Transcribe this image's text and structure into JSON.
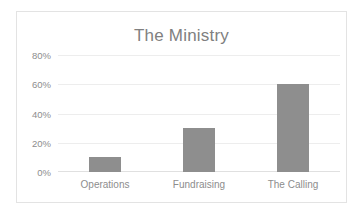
{
  "chart_data": {
    "type": "bar",
    "title": "The Ministry",
    "categories": [
      "Operations",
      "Fundraising",
      "The Calling"
    ],
    "values": [
      10,
      30,
      60
    ],
    "value_suffix": "%",
    "xlabel": "",
    "ylabel": "",
    "ylim": [
      0,
      80
    ],
    "ytick_values": [
      0,
      20,
      40,
      60,
      80
    ],
    "ytick_labels": [
      "0%",
      "20%",
      "40%",
      "60%",
      "80%"
    ],
    "grid": true,
    "grid_axis": "y",
    "legend": false,
    "legend_position": "none",
    "series": [
      {
        "name": "",
        "values": [
          10,
          30,
          60
        ]
      }
    ],
    "colors": {
      "bar_fill": "#8e8e8e",
      "title_text": "#808080",
      "tick_text": "#8d8d8d",
      "gridline": "#ededed",
      "axis_line": "#e0e0e0",
      "frame_border": "#e3e3e3",
      "background": "#ffffff"
    }
  }
}
